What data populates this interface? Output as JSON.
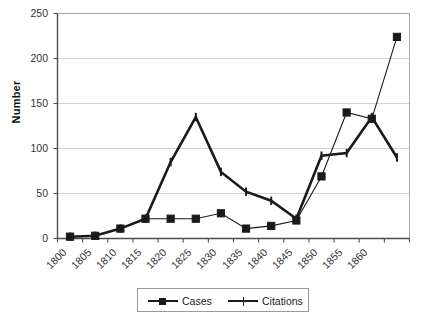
{
  "chart_data": {
    "type": "line",
    "title": "",
    "xlabel": "",
    "ylabel": "Number",
    "x": [
      1800,
      1805,
      1810,
      1815,
      1820,
      1825,
      1830,
      1835,
      1840,
      1845,
      1850,
      1855,
      1860,
      1865
    ],
    "x_tick_labels": [
      "1800",
      "1805",
      "1810",
      "1815",
      "1820",
      "1825",
      "1830",
      "1835",
      "1840",
      "1845",
      "1850",
      "1855",
      "1860",
      ""
    ],
    "y_tick_labels": [
      "0",
      "50",
      "100",
      "150",
      "200",
      "250"
    ],
    "y_ticks": [
      0,
      50,
      100,
      150,
      200,
      250
    ],
    "ylim": [
      0,
      250
    ],
    "grid": "horizontal",
    "legend_position": "bottom",
    "series": [
      {
        "name": "Cases",
        "marker": "square",
        "values": [
          2,
          3,
          11,
          22,
          22,
          22,
          28,
          11,
          14,
          20,
          69,
          140,
          133,
          224
        ]
      },
      {
        "name": "Citations",
        "marker": "plus",
        "values": [
          2,
          3,
          11,
          22,
          85,
          135,
          74,
          52,
          42,
          22,
          92,
          95,
          135,
          90
        ]
      }
    ],
    "colors": {
      "series_line": "#1a1a1a",
      "gridline": "#d2d2d2",
      "axis": "#4d4d4d",
      "background": "#ffffff"
    }
  },
  "legend": {
    "items": [
      {
        "label": "Cases"
      },
      {
        "label": "Citations"
      }
    ]
  }
}
